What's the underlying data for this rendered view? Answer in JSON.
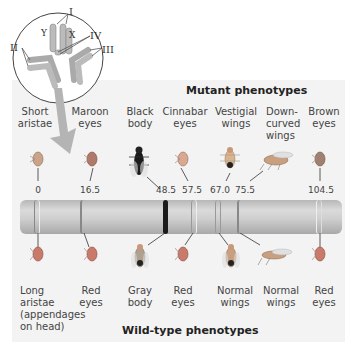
{
  "inset": {
    "labels": [
      "I",
      "II",
      "III",
      "IV",
      "Y",
      "X"
    ]
  },
  "mutant": {
    "title": "Mutant phenotypes",
    "items": [
      {
        "line1": "Short",
        "line2": "aristae",
        "line3": "",
        "position": "0"
      },
      {
        "line1": "Maroon",
        "line2": "eyes",
        "line3": "",
        "position": "16.5"
      },
      {
        "line1": "Black",
        "line2": "body",
        "line3": "",
        "position": "48.5"
      },
      {
        "line1": "Cinnabar",
        "line2": "eyes",
        "line3": "",
        "position": "57.5"
      },
      {
        "line1": "Vestigial",
        "line2": "wings",
        "line3": "",
        "position": "67.0"
      },
      {
        "line1": "Down-",
        "line2": "curved",
        "line3": "wings",
        "position": "75.5"
      },
      {
        "line1": "Brown",
        "line2": "eyes",
        "line3": "",
        "position": "104.5"
      }
    ]
  },
  "wildtype": {
    "title": "Wild-type phenotypes",
    "items": [
      {
        "line1": "Long",
        "line2": "aristae",
        "line3": "(appendages",
        "line4": "on head)"
      },
      {
        "line1": "Red",
        "line2": "eyes"
      },
      {
        "line1": "Gray",
        "line2": "body"
      },
      {
        "line1": "Red",
        "line2": "eyes"
      },
      {
        "line1": "Normal",
        "line2": "wings"
      },
      {
        "line1": "Normal",
        "line2": "wings"
      },
      {
        "line1": "Red",
        "line2": "eyes"
      }
    ]
  },
  "colors": {
    "panel": "#f3f3f3",
    "chromosome": "#c8c8c8",
    "arrow": "#b0b0b0",
    "black_band": "#1a1a1a"
  }
}
